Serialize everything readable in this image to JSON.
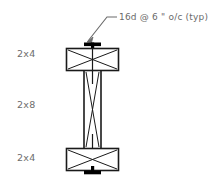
{
  "drawing": {
    "title": "built-up-wood-column-section",
    "background_color": "#ffffff",
    "line_color": "#1a1a1a",
    "fastener_color": "#000000",
    "text_color": "#6d6d6d",
    "annotation": {
      "text": "16d @ 6 \" o/c (typ)",
      "leader_name": "callout-leader-line",
      "arrow_name": "callout-arrowhead"
    },
    "labels": [
      {
        "name": "top-chord",
        "text": "2x4"
      },
      {
        "name": "web-member",
        "text": "2x8"
      },
      {
        "name": "bottom-chord",
        "text": "2x4"
      }
    ],
    "members": [
      {
        "name": "top-member",
        "label": "2x4",
        "shape": "rectangle-with-cross",
        "x": 66,
        "y": 48,
        "width": 53,
        "height": 23
      },
      {
        "name": "middle-member",
        "label": "2x8",
        "shape": "tall-rectangle-with-x-brace",
        "x": 83,
        "y": 71,
        "width": 19,
        "height": 77
      },
      {
        "name": "bottom-member",
        "label": "2x4",
        "shape": "rectangle-with-cross",
        "x": 66,
        "y": 148,
        "width": 53,
        "height": 23
      }
    ],
    "fasteners": [
      {
        "name": "top-nail-plate",
        "x": 84,
        "y": 43,
        "width": 17,
        "height": 4
      },
      {
        "name": "top-nail-shank",
        "x": 91,
        "y": 43,
        "width": 3,
        "height": 8
      },
      {
        "name": "bottom-nail-plate",
        "x": 84,
        "y": 171,
        "width": 17,
        "height": 4
      },
      {
        "name": "bottom-nail-shank",
        "x": 91,
        "y": 167,
        "width": 3,
        "height": 8
      }
    ]
  }
}
